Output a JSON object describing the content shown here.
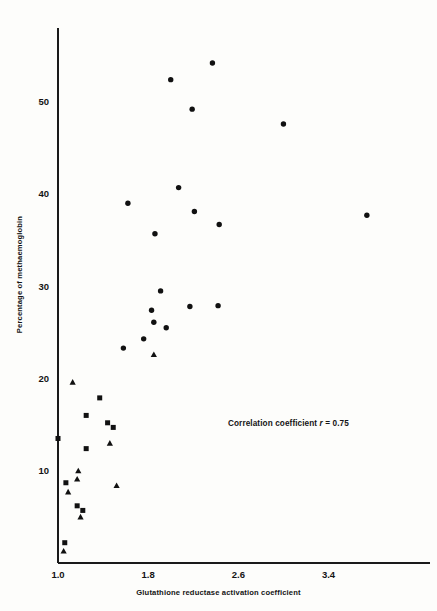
{
  "chart_data": {
    "type": "scatter",
    "title": "",
    "xlabel": "Glutathione reductase activation coefficient",
    "ylabel": "Percentage of methaemoglobin",
    "xlim": [
      1.0,
      4.3
    ],
    "ylim": [
      0,
      58
    ],
    "xticks": [
      1.0,
      1.8,
      2.6,
      3.4
    ],
    "xticklabels": [
      "1.0",
      "1.8",
      "2.6",
      "3.4"
    ],
    "yticks": [
      10,
      20,
      30,
      40,
      50
    ],
    "yticklabels": [
      "10",
      "20",
      "30",
      "40",
      "50"
    ],
    "grid": false,
    "legend": "none",
    "annotations": [
      {
        "name": "correlation-annotation",
        "prefix": "Correlation coefficient ",
        "symbol": "r",
        "suffix": " = 0.75",
        "text": "Correlation coefficient r = 0.75",
        "x": 2.5,
        "y": 15.7
      }
    ],
    "series": [
      {
        "name": "circle-series",
        "marker": "circle",
        "color": "#111111",
        "points": [
          {
            "x": 2.37,
            "y": 54.2
          },
          {
            "x": 2.0,
            "y": 52.4
          },
          {
            "x": 2.19,
            "y": 49.2
          },
          {
            "x": 3.0,
            "y": 47.6
          },
          {
            "x": 2.07,
            "y": 40.7
          },
          {
            "x": 1.62,
            "y": 39.0
          },
          {
            "x": 2.21,
            "y": 38.1
          },
          {
            "x": 3.74,
            "y": 37.7
          },
          {
            "x": 2.43,
            "y": 36.7
          },
          {
            "x": 1.86,
            "y": 35.7
          },
          {
            "x": 1.91,
            "y": 29.5
          },
          {
            "x": 2.17,
            "y": 27.8
          },
          {
            "x": 2.42,
            "y": 27.9
          },
          {
            "x": 1.83,
            "y": 27.4
          },
          {
            "x": 1.85,
            "y": 26.1
          },
          {
            "x": 1.96,
            "y": 25.5
          },
          {
            "x": 1.76,
            "y": 24.3
          },
          {
            "x": 1.58,
            "y": 23.3
          }
        ]
      },
      {
        "name": "square-series",
        "marker": "square",
        "color": "#111111",
        "points": [
          {
            "x": 1.37,
            "y": 17.9
          },
          {
            "x": 1.25,
            "y": 16.0
          },
          {
            "x": 1.44,
            "y": 15.2
          },
          {
            "x": 1.49,
            "y": 14.7
          },
          {
            "x": 1.0,
            "y": 13.5
          },
          {
            "x": 1.25,
            "y": 12.4
          },
          {
            "x": 1.07,
            "y": 8.7
          },
          {
            "x": 1.17,
            "y": 6.2
          },
          {
            "x": 1.22,
            "y": 5.7
          },
          {
            "x": 1.06,
            "y": 2.2
          }
        ]
      },
      {
        "name": "triangle-series",
        "marker": "triangle",
        "color": "#111111",
        "points": [
          {
            "x": 1.85,
            "y": 22.6
          },
          {
            "x": 1.13,
            "y": 19.6
          },
          {
            "x": 1.46,
            "y": 13.0
          },
          {
            "x": 1.18,
            "y": 10.0
          },
          {
            "x": 1.17,
            "y": 9.1
          },
          {
            "x": 1.52,
            "y": 8.4
          },
          {
            "x": 1.09,
            "y": 7.7
          },
          {
            "x": 1.2,
            "y": 5.0
          },
          {
            "x": 1.05,
            "y": 1.3
          }
        ]
      }
    ]
  }
}
